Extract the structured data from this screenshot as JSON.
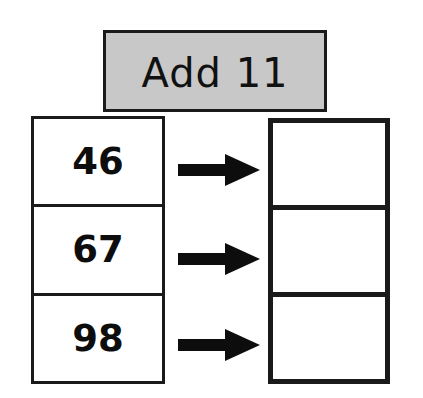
{
  "worksheet": {
    "header": {
      "label": "Add 11",
      "background_color": "#c8c8c8",
      "border_color": "#1a1a1a"
    },
    "input_column": {
      "name": "input-numbers",
      "cells": [
        {
          "value": "46"
        },
        {
          "value": "67"
        },
        {
          "value": "98"
        }
      ]
    },
    "output_column": {
      "name": "answer-boxes",
      "cells": [
        {
          "value": ""
        },
        {
          "value": ""
        },
        {
          "value": ""
        }
      ]
    },
    "arrows": [
      {
        "name": "arrow-right-icon-1"
      },
      {
        "name": "arrow-right-icon-2"
      },
      {
        "name": "arrow-right-icon-3"
      }
    ],
    "colors": {
      "ink": "#0d0d0d",
      "rule": "#1a1a1a",
      "paper": "#ffffff",
      "band": "#c8c8c8"
    }
  }
}
